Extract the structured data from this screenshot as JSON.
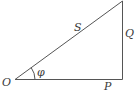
{
  "diagram": {
    "type": "right-triangle",
    "title": "",
    "vertices": {
      "origin": {
        "label": "O",
        "x": 15,
        "y": 79
      },
      "right_angle": {
        "label": "",
        "x": 122,
        "y": 79
      },
      "apex": {
        "label": "",
        "x": 122,
        "y": 1
      }
    },
    "sides": {
      "hypotenuse": {
        "label": "S"
      },
      "vertical": {
        "label": "Q"
      },
      "horizontal": {
        "label": "P"
      }
    },
    "angle": {
      "label": "φ",
      "at": "O"
    },
    "colors": {
      "line": "#555555",
      "text": "#3a3a3a",
      "background": "#ffffff"
    }
  }
}
